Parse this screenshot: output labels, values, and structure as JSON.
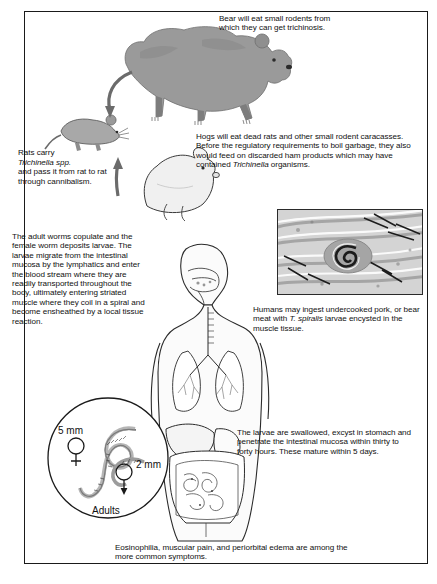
{
  "figure": {
    "frame_border_color": "#1a1a1a",
    "cycle_arrow_color": "#c6c6c6",
    "dark_arrow_color": "#6b6b6b"
  },
  "blocks": {
    "bear": "Bear will eat small rodents from which they can get trichinosis.",
    "rats_line1": "Rats carry",
    "rats_italic": "Trichinella  spp.",
    "rats_rest": "and pass it from rat to rat through cannibalism.",
    "hogs_part1": "Hogs will eat dead rats and other small rodent caracasses. Before the regulatory requirements to boil garbage, they also would feed on discarded ham products which may have contained ",
    "hogs_italic": "Trichinella",
    "hogs_part2": " organisms.",
    "adult_worms": "The adult worms copulate and the female worm deposits larvae. The larvae migrate from the intestinal mucosa by the lymphatics and enter the blood stream where they are readily transported throughout the body, ultimately entering striated muscle where they coil in a spiral and become ensheathed by a local tissue reaction.",
    "humans_part1": "Humans may ingest undercooked pork, or bear meat with ",
    "humans_italic": "T. spiralis",
    "humans_part2": " larvae encysted in the muscle tissue.",
    "larvae": "The larvae are swallowed, excyst in stomach and penetrate the intestinal mucosa within thirty to forty hours. These mature within 5 days.",
    "eosinophilia": "Eosinophilia, muscular pain, and periorbital edema are among the more common symptoms."
  },
  "adults_inset": {
    "female_size": "5 mm",
    "male_size": "2 mm",
    "label": "Adults",
    "female_symbol": "♀",
    "male_symbol": "♂"
  },
  "icons": {
    "bear": "bear-illustration",
    "rat": "rat-illustration",
    "hog": "hog-illustration",
    "human": "human-anatomy-illustration",
    "micrograph": "encysted-larva-micrograph",
    "adults_worms": "adult-worms-illustration"
  }
}
